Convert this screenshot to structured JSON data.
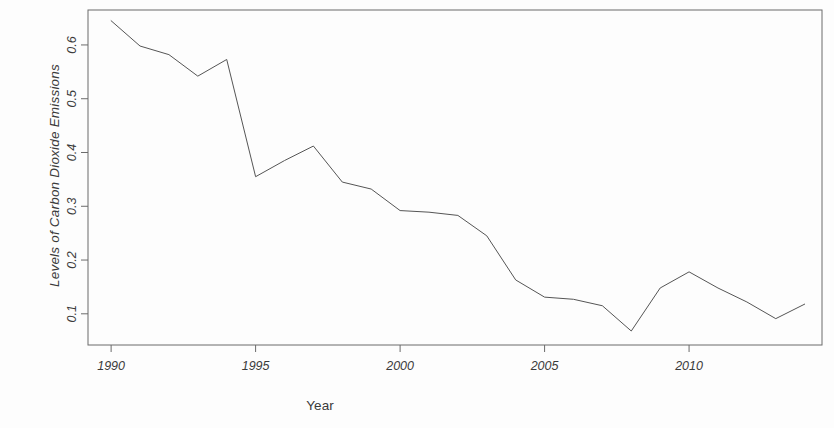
{
  "chart_data": {
    "type": "line",
    "title": "",
    "xlabel": "Year",
    "ylabel": "Levels of Carbon Dioxide Emissions",
    "x": [
      1990,
      1991,
      1992,
      1993,
      1994,
      1995,
      1996,
      1997,
      1998,
      1999,
      2000,
      2001,
      2002,
      2003,
      2004,
      2005,
      2006,
      2007,
      2008,
      2009,
      2010,
      2011,
      2012,
      2013,
      2014
    ],
    "values": [
      0.645,
      0.598,
      0.582,
      0.542,
      0.573,
      0.355,
      0.385,
      0.412,
      0.345,
      0.332,
      0.292,
      0.289,
      0.283,
      0.245,
      0.163,
      0.131,
      0.127,
      0.115,
      0.068,
      0.148,
      0.178,
      0.148,
      0.122,
      0.091,
      0.118
    ],
    "series": [
      {
        "name": "Levels of Carbon Dioxide Emissions",
        "values": [
          0.645,
          0.598,
          0.582,
          0.542,
          0.573,
          0.355,
          0.385,
          0.412,
          0.345,
          0.332,
          0.292,
          0.289,
          0.283,
          0.245,
          0.163,
          0.131,
          0.127,
          0.115,
          0.068,
          0.148,
          0.178,
          0.148,
          0.122,
          0.091,
          0.118
        ],
        "color": "#555555"
      }
    ],
    "xticks": [
      1990,
      1995,
      2000,
      2005,
      2010
    ],
    "xtick_labels": [
      "1990",
      "1995",
      "2000",
      "2005",
      "2010"
    ],
    "yticks": [
      0.1,
      0.2,
      0.3,
      0.4,
      0.5,
      0.6
    ],
    "ytick_labels": [
      "0.1",
      "0.2",
      "0.3",
      "0.4",
      "0.5",
      "0.6"
    ],
    "xlim": [
      1989.2,
      2014.6
    ],
    "ylim": [
      0.042,
      0.665
    ],
    "grid": false,
    "legend": false,
    "frame": true,
    "line_color": "#555555",
    "line_width": 1,
    "background_color": "#fdfdfd",
    "axis_color": "#6b6b6b"
  }
}
